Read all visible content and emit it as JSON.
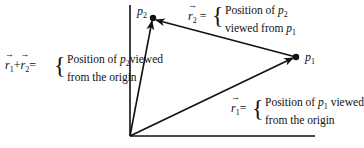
{
  "points": {
    "p1": {
      "name": "p",
      "sub": "1"
    },
    "p2": {
      "name": "p",
      "sub": "2"
    }
  },
  "labels": {
    "r2": {
      "vector": "r",
      "sub": "2",
      "equals": "=",
      "brace": "{",
      "line1_prefix": "Position of ",
      "line1_var": "p",
      "line1_sub": "2",
      "line2_prefix": "viewed from ",
      "line2_var": "p",
      "line2_sub": "1"
    },
    "r1": {
      "vector": "r",
      "sub": "1",
      "equals": "=",
      "brace": "{",
      "line1_prefix": "Position of ",
      "line1_var": "p",
      "line1_sub": "1",
      "line1_suffix": " viewed",
      "line2": "from the origin"
    },
    "sum": {
      "vector_a": "r",
      "sub_a": "1",
      "plus": "+",
      "vector_b": "r",
      "sub_b": "2",
      "equals": "=",
      "brace": "{",
      "line1_prefix": "Position of ",
      "line1_var": "p",
      "line1_sub": "2",
      "line1_suffix": "viewed",
      "line2": "from the origin"
    }
  },
  "colors": {
    "ink": "#111111",
    "background": "#ffffff"
  }
}
